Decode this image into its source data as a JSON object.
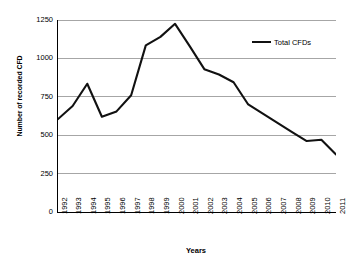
{
  "chart_data": {
    "type": "line",
    "title": "",
    "xlabel": "Years",
    "ylabel": "Number of recorded CFD",
    "categories": [
      "1992",
      "1993",
      "1994",
      "1995",
      "1996",
      "1997",
      "1998",
      "1999",
      "2000",
      "2001",
      "2002",
      "2003",
      "2004",
      "2005",
      "2006",
      "2007",
      "2008",
      "2009",
      "2010",
      "2011"
    ],
    "series": [
      {
        "name": "Total CFDs",
        "color": "#111111",
        "values": [
          605,
          690,
          835,
          620,
          655,
          760,
          1085,
          1140,
          1225,
          1080,
          930,
          895,
          845,
          700,
          640,
          580,
          520,
          462,
          470,
          375
        ]
      }
    ],
    "ylim": [
      0,
      1250
    ],
    "yticks": [
      0,
      250,
      500,
      750,
      1000,
      1250
    ],
    "ytick_labels": [
      "0",
      "250",
      "500",
      "750",
      "1000",
      "1250"
    ],
    "grid": "horizontal",
    "legend_position": "top-right",
    "legend": [
      "Total CFDs"
    ]
  },
  "style": {
    "line_color": "#111111",
    "grid_color": "#a6a6a6",
    "axis_color": "#000000",
    "background": "#ffffff"
  }
}
